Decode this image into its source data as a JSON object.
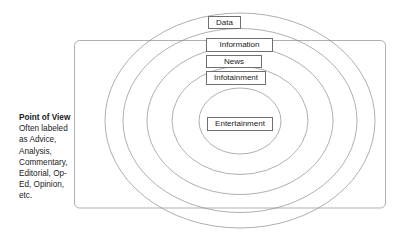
{
  "diagram": {
    "stroke_color": "#8c8c8c",
    "label_border_color": "#6f6f6f",
    "text_color": "#1b1b1b",
    "background": "#ffffff",
    "rings": [
      {
        "id": "data",
        "label": "Data",
        "order": 1
      },
      {
        "id": "information",
        "label": "Information",
        "order": 2
      },
      {
        "id": "news",
        "label": "News",
        "order": 3
      },
      {
        "id": "infotainment",
        "label": "Infotainment",
        "order": 4
      },
      {
        "id": "entertainment",
        "label": "Entertainment",
        "order": 5
      }
    ],
    "point_of_view": {
      "title": "Point of View",
      "lines": [
        "Often labeled",
        "as Advice,",
        "Analysis,",
        "Commentary,",
        "Editorial, Op-",
        "Ed, Opinion,",
        "etc."
      ]
    }
  }
}
